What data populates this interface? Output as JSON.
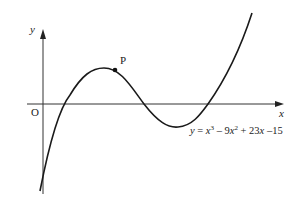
{
  "diagram": {
    "type": "function-graph",
    "axes": {
      "x_label": "x",
      "y_label": "y",
      "origin_label": "O"
    },
    "point": {
      "label": "P"
    },
    "equation": {
      "y": "y",
      "eq": " = ",
      "x3_base": "x",
      "x3_exp": "3",
      "minus1": " – 9",
      "x2_base": "x",
      "x2_exp": "2",
      "plus": " + 23",
      "x_term": "x",
      "const": " –15"
    },
    "equation_text": "y = x^3 – 9x^2 + 23x –15",
    "colors": {
      "curve": "#1a1a1a",
      "axis": "#333333"
    }
  }
}
